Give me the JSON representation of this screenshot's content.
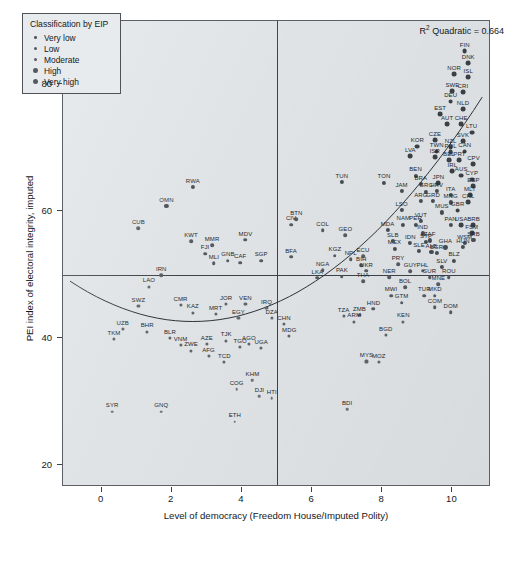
{
  "chart": {
    "type": "scatter",
    "title": "",
    "annotation": "R² Quadratic = 0.664",
    "annotation_prefix": "R",
    "annotation_sup": "2",
    "annotation_suffix": " Quadratic = 0.664",
    "xlabel": "Level of democracy (Freedom House/Imputed Polity)",
    "ylabel": "PEI index of electoral integrity, imputed",
    "xlim": [
      -1.1,
      11.1
    ],
    "ylim": [
      16.5,
      90.0
    ],
    "xticks": [
      0,
      2,
      4,
      6,
      8,
      10
    ],
    "yticks": [
      20,
      40,
      60,
      80
    ],
    "grid": false,
    "ref_line_h": 50,
    "ref_line_v": 5,
    "background_color": "#dfe3e6",
    "point_color": "#4a5056",
    "frame_color": "#5a6066"
  },
  "legend": {
    "title": "Classification by EIP",
    "position": "top-left",
    "items": [
      {
        "label": "Very low",
        "key": "vlow"
      },
      {
        "label": "Low",
        "key": "low"
      },
      {
        "label": "Moderate",
        "key": "mod"
      },
      {
        "label": "High",
        "key": "high"
      },
      {
        "label": "Very high",
        "key": "vhigh"
      }
    ]
  },
  "chart_data": {
    "type": "scatter",
    "title": "",
    "xlabel": "Level of democracy (Freedom House/Imputed Polity)",
    "ylabel": "PEI index of electoral integrity, imputed",
    "xlim": [
      -1.1,
      11.1
    ],
    "ylim": [
      16.5,
      90.0
    ],
    "xticks": [
      0,
      2,
      4,
      6,
      8,
      10
    ],
    "yticks": [
      20,
      40,
      60,
      80
    ],
    "grid": false,
    "annotation": "R² Quadratic = 0.664",
    "r2_quadratic": 0.664,
    "reference_lines": {
      "horizontal_y": 50,
      "vertical_x": 5
    },
    "legend_title": "Classification by EIP",
    "legend_entries": [
      "Very low",
      "Low",
      "Moderate",
      "High",
      "Very high"
    ],
    "fit": {
      "kind": "quadratic",
      "note": "U-shaped quadratic trend line fitted across the full x-range"
    },
    "points": [
      {
        "label": "FIN",
        "x": 10.35,
        "y": 85.2,
        "cls": "vhigh"
      },
      {
        "label": "DNK",
        "x": 10.45,
        "y": 83.3,
        "cls": "vhigh"
      },
      {
        "label": "NOR",
        "x": 10.05,
        "y": 81.6,
        "cls": "vhigh"
      },
      {
        "label": "ISL",
        "x": 10.45,
        "y": 81.2,
        "cls": "vhigh"
      },
      {
        "label": "SWE",
        "x": 10.0,
        "y": 78.9,
        "cls": "vhigh"
      },
      {
        "label": "CRI",
        "x": 10.3,
        "y": 78.8,
        "cls": "vhigh"
      },
      {
        "label": "DEU",
        "x": 9.95,
        "y": 77.3,
        "cls": "vhigh"
      },
      {
        "label": "NLD",
        "x": 10.3,
        "y": 76.1,
        "cls": "vhigh"
      },
      {
        "label": "EST",
        "x": 9.65,
        "y": 75.3,
        "cls": "vhigh"
      },
      {
        "label": "AUT",
        "x": 9.85,
        "y": 73.8,
        "cls": "vhigh"
      },
      {
        "label": "CHE",
        "x": 10.25,
        "y": 73.7,
        "cls": "vhigh"
      },
      {
        "label": "LTU",
        "x": 10.55,
        "y": 72.4,
        "cls": "vhigh"
      },
      {
        "label": "CZE",
        "x": 9.5,
        "y": 71.2,
        "cls": "vhigh"
      },
      {
        "label": "SVK",
        "x": 10.3,
        "y": 71.0,
        "cls": "vhigh"
      },
      {
        "label": "NZL",
        "x": 9.95,
        "y": 70.1,
        "cls": "vhigh"
      },
      {
        "label": "KOR",
        "x": 9.0,
        "y": 70.2,
        "cls": "vhigh"
      },
      {
        "label": "TWN",
        "x": 9.55,
        "y": 69.4,
        "cls": "vhigh"
      },
      {
        "label": "POL",
        "x": 9.95,
        "y": 69.3,
        "cls": "vhigh"
      },
      {
        "label": "CAN",
        "x": 10.35,
        "y": 69.4,
        "cls": "vhigh"
      },
      {
        "label": "LVA",
        "x": 8.8,
        "y": 68.7,
        "cls": "vhigh"
      },
      {
        "label": "ISR",
        "x": 9.5,
        "y": 68.5,
        "cls": "vhigh"
      },
      {
        "label": "BEL",
        "x": 9.9,
        "y": 68.0,
        "cls": "vhigh"
      },
      {
        "label": "PRT",
        "x": 10.2,
        "y": 68.0,
        "cls": "vhigh"
      },
      {
        "label": "CPV",
        "x": 10.6,
        "y": 67.4,
        "cls": "vhigh"
      },
      {
        "label": "IRL",
        "x": 10.0,
        "y": 66.3,
        "cls": "vhigh"
      },
      {
        "label": "AUS",
        "x": 10.25,
        "y": 65.6,
        "cls": "vhigh"
      },
      {
        "label": "BEN",
        "x": 8.95,
        "y": 65.6,
        "cls": "high"
      },
      {
        "label": "CYP",
        "x": 10.55,
        "y": 65.0,
        "cls": "vhigh"
      },
      {
        "label": "ESP",
        "x": 10.6,
        "y": 63.9,
        "cls": "vhigh"
      },
      {
        "label": "JPN",
        "x": 9.6,
        "y": 64.4,
        "cls": "vhigh"
      },
      {
        "label": "BRA",
        "x": 9.1,
        "y": 64.3,
        "cls": "high"
      },
      {
        "label": "TON",
        "x": 8.05,
        "y": 64.5,
        "cls": "high"
      },
      {
        "label": "TUN",
        "x": 6.85,
        "y": 64.6,
        "cls": "high"
      },
      {
        "label": "HRV",
        "x": 9.55,
        "y": 63.2,
        "cls": "high"
      },
      {
        "label": "GRC",
        "x": 9.25,
        "y": 63.1,
        "cls": "high"
      },
      {
        "label": "JAM",
        "x": 8.55,
        "y": 63.2,
        "cls": "high"
      },
      {
        "label": "ITA",
        "x": 9.95,
        "y": 62.6,
        "cls": "high"
      },
      {
        "label": "MLT",
        "x": 10.5,
        "y": 62.6,
        "cls": "vhigh"
      },
      {
        "label": "ARG",
        "x": 9.1,
        "y": 61.6,
        "cls": "high"
      },
      {
        "label": "GRD",
        "x": 9.45,
        "y": 61.6,
        "cls": "high"
      },
      {
        "label": "MNG",
        "x": 9.95,
        "y": 61.4,
        "cls": "high"
      },
      {
        "label": "CHL",
        "x": 10.45,
        "y": 61.4,
        "cls": "vhigh"
      },
      {
        "label": "LSO",
        "x": 8.55,
        "y": 60.2,
        "cls": "high"
      },
      {
        "label": "MUS",
        "x": 9.7,
        "y": 59.8,
        "cls": "high"
      },
      {
        "label": "GBR",
        "x": 10.15,
        "y": 60.1,
        "cls": "vhigh"
      },
      {
        "label": "VUT",
        "x": 9.1,
        "y": 58.5,
        "cls": "high"
      },
      {
        "label": "NAM",
        "x": 8.6,
        "y": 57.9,
        "cls": "high"
      },
      {
        "label": "PER",
        "x": 8.95,
        "y": 57.9,
        "cls": "high"
      },
      {
        "label": "PAN",
        "x": 9.95,
        "y": 57.8,
        "cls": "high"
      },
      {
        "label": "USA",
        "x": 10.25,
        "y": 57.8,
        "cls": "vhigh"
      },
      {
        "label": "BRB",
        "x": 10.6,
        "y": 57.8,
        "cls": "vhigh"
      },
      {
        "label": "FSM",
        "x": 10.55,
        "y": 56.5,
        "cls": "vhigh"
      },
      {
        "label": "IND",
        "x": 9.15,
        "y": 56.5,
        "cls": "high"
      },
      {
        "label": "MDA",
        "x": 8.15,
        "y": 57.0,
        "cls": "high"
      },
      {
        "label": "ZAF",
        "x": 9.35,
        "y": 55.4,
        "cls": "high"
      },
      {
        "label": "IDN",
        "x": 8.8,
        "y": 55.0,
        "cls": "high"
      },
      {
        "label": "STP",
        "x": 9.25,
        "y": 55.1,
        "cls": "high"
      },
      {
        "label": "WSM",
        "x": 10.35,
        "y": 55.0,
        "cls": "high"
      },
      {
        "label": "GHA",
        "x": 9.8,
        "y": 54.3,
        "cls": "high"
      },
      {
        "label": "HUN",
        "x": 10.3,
        "y": 54.4,
        "cls": "high"
      },
      {
        "label": "SLE",
        "x": 9.05,
        "y": 53.7,
        "cls": "high"
      },
      {
        "label": "ALB",
        "x": 9.4,
        "y": 53.6,
        "cls": "high"
      },
      {
        "label": "BGR",
        "x": 9.55,
        "y": 53.4,
        "cls": "high"
      },
      {
        "label": "BLZ",
        "x": 10.05,
        "y": 52.2,
        "cls": "high"
      },
      {
        "label": "SRB",
        "x": 10.6,
        "y": 55.5,
        "cls": "high"
      },
      {
        "label": "MEX",
        "x": 8.35,
        "y": 54.1,
        "cls": "high"
      },
      {
        "label": "SLB",
        "x": 8.3,
        "y": 55.3,
        "cls": "high"
      },
      {
        "label": "COL",
        "x": 6.3,
        "y": 57.0,
        "cls": "mod"
      },
      {
        "label": "GEO",
        "x": 6.95,
        "y": 56.2,
        "cls": "mod"
      },
      {
        "label": "BTN",
        "x": 5.55,
        "y": 58.7,
        "cls": "mod"
      },
      {
        "label": "CIV",
        "x": 5.4,
        "y": 57.9,
        "cls": "mod"
      },
      {
        "label": "MDV",
        "x": 4.1,
        "y": 55.5,
        "cls": "mod"
      },
      {
        "label": "ECU",
        "x": 7.45,
        "y": 52.9,
        "cls": "mod"
      },
      {
        "label": "SLV",
        "x": 9.7,
        "y": 51.2,
        "cls": "high"
      },
      {
        "label": "ROU",
        "x": 9.9,
        "y": 49.6,
        "cls": "mod"
      },
      {
        "label": "PHL",
        "x": 9.15,
        "y": 50.6,
        "cls": "mod"
      },
      {
        "label": "SUR",
        "x": 9.35,
        "y": 49.6,
        "cls": "mod"
      },
      {
        "label": "MNE",
        "x": 9.6,
        "y": 48.5,
        "cls": "mod"
      },
      {
        "label": "MKD",
        "x": 9.5,
        "y": 46.7,
        "cls": "mod"
      },
      {
        "label": "DOM",
        "x": 9.95,
        "y": 44.1,
        "cls": "mod"
      },
      {
        "label": "PRY",
        "x": 8.45,
        "y": 51.6,
        "cls": "mod"
      },
      {
        "label": "GUY",
        "x": 8.8,
        "y": 50.5,
        "cls": "mod"
      },
      {
        "label": "NPL",
        "x": 7.1,
        "y": 52.4,
        "cls": "mod"
      },
      {
        "label": "BIH",
        "x": 7.4,
        "y": 51.5,
        "cls": "mod"
      },
      {
        "label": "KGZ",
        "x": 6.65,
        "y": 53.0,
        "cls": "mod"
      },
      {
        "label": "UKR",
        "x": 7.55,
        "y": 50.6,
        "cls": "mod"
      },
      {
        "label": "NER",
        "x": 8.2,
        "y": 49.6,
        "cls": "mod"
      },
      {
        "label": "THA",
        "x": 7.45,
        "y": 49.0,
        "cls": "mod"
      },
      {
        "label": "PAK",
        "x": 6.85,
        "y": 49.7,
        "cls": "mod"
      },
      {
        "label": "LKA",
        "x": 6.15,
        "y": 49.5,
        "cls": "mod"
      },
      {
        "label": "NGA",
        "x": 6.3,
        "y": 50.7,
        "cls": "mod"
      },
      {
        "label": "BFA",
        "x": 5.4,
        "y": 52.8,
        "cls": "mod"
      },
      {
        "label": "BOL",
        "x": 8.65,
        "y": 48.0,
        "cls": "mod"
      },
      {
        "label": "MWI",
        "x": 8.25,
        "y": 46.7,
        "cls": "mod"
      },
      {
        "label": "TUR",
        "x": 9.2,
        "y": 46.7,
        "cls": "mod"
      },
      {
        "label": "GTM",
        "x": 8.55,
        "y": 45.6,
        "cls": "mod"
      },
      {
        "label": "COM",
        "x": 9.5,
        "y": 44.9,
        "cls": "mod"
      },
      {
        "label": "HND",
        "x": 7.75,
        "y": 44.6,
        "cls": "mod"
      },
      {
        "label": "KEN",
        "x": 8.6,
        "y": 42.6,
        "cls": "low"
      },
      {
        "label": "TZA",
        "x": 6.9,
        "y": 43.5,
        "cls": "low"
      },
      {
        "label": "ZMB",
        "x": 7.35,
        "y": 43.6,
        "cls": "low"
      },
      {
        "label": "ARM",
        "x": 7.2,
        "y": 42.6,
        "cls": "low"
      },
      {
        "label": "BGD",
        "x": 8.1,
        "y": 40.5,
        "cls": "low"
      },
      {
        "label": "MYS",
        "x": 7.55,
        "y": 36.3,
        "cls": "low"
      },
      {
        "label": "MOZ",
        "x": 7.9,
        "y": 36.2,
        "cls": "low"
      },
      {
        "label": "BDI",
        "x": 7.0,
        "y": 28.8,
        "cls": "vlow"
      },
      {
        "label": "SGP",
        "x": 4.55,
        "y": 52.2,
        "cls": "mod"
      },
      {
        "label": "CAF",
        "x": 3.95,
        "y": 51.9,
        "cls": "mod"
      },
      {
        "label": "GNB",
        "x": 3.6,
        "y": 52.2,
        "cls": "mod"
      },
      {
        "label": "MLI",
        "x": 3.2,
        "y": 51.8,
        "cls": "mod"
      },
      {
        "label": "FJI",
        "x": 2.95,
        "y": 53.3,
        "cls": "mod"
      },
      {
        "label": "MMR",
        "x": 3.15,
        "y": 54.6,
        "cls": "mod"
      },
      {
        "label": "KWT",
        "x": 2.55,
        "y": 55.3,
        "cls": "mod"
      },
      {
        "label": "CUB",
        "x": 1.05,
        "y": 57.3,
        "cls": "mod"
      },
      {
        "label": "OMN",
        "x": 1.85,
        "y": 60.8,
        "cls": "high"
      },
      {
        "label": "RWA",
        "x": 2.6,
        "y": 63.8,
        "cls": "high"
      },
      {
        "label": "IRN",
        "x": 1.7,
        "y": 49.9,
        "cls": "mod"
      },
      {
        "label": "LAO",
        "x": 1.35,
        "y": 48.1,
        "cls": "low"
      },
      {
        "label": "SWZ",
        "x": 1.05,
        "y": 45.0,
        "cls": "low"
      },
      {
        "label": "CMR",
        "x": 2.25,
        "y": 45.2,
        "cls": "low"
      },
      {
        "label": "KAZ",
        "x": 2.6,
        "y": 44.0,
        "cls": "low"
      },
      {
        "label": "MRT",
        "x": 3.25,
        "y": 43.8,
        "cls": "low"
      },
      {
        "label": "JOR",
        "x": 3.55,
        "y": 45.4,
        "cls": "low"
      },
      {
        "label": "VEN",
        "x": 4.1,
        "y": 45.3,
        "cls": "low"
      },
      {
        "label": "IRQ",
        "x": 4.7,
        "y": 44.7,
        "cls": "low"
      },
      {
        "label": "EGY",
        "x": 3.9,
        "y": 43.2,
        "cls": "low"
      },
      {
        "label": "DZA",
        "x": 4.85,
        "y": 43.2,
        "cls": "low"
      },
      {
        "label": "CHN",
        "x": 5.2,
        "y": 42.2,
        "cls": "low"
      },
      {
        "label": "UZB",
        "x": 0.6,
        "y": 41.4,
        "cls": "low"
      },
      {
        "label": "BHR",
        "x": 1.3,
        "y": 41.0,
        "cls": "low"
      },
      {
        "label": "TKM",
        "x": 0.35,
        "y": 39.8,
        "cls": "low"
      },
      {
        "label": "BLR",
        "x": 1.95,
        "y": 40.0,
        "cls": "low"
      },
      {
        "label": "VNM",
        "x": 2.25,
        "y": 38.9,
        "cls": "low"
      },
      {
        "label": "AZE",
        "x": 3.0,
        "y": 39.0,
        "cls": "low"
      },
      {
        "label": "TJK",
        "x": 3.55,
        "y": 39.6,
        "cls": "low"
      },
      {
        "label": "AGO",
        "x": 4.2,
        "y": 39.0,
        "cls": "low"
      },
      {
        "label": "ZWE",
        "x": 2.55,
        "y": 38.0,
        "cls": "low"
      },
      {
        "label": "AFG",
        "x": 3.05,
        "y": 37.1,
        "cls": "low"
      },
      {
        "label": "TCD",
        "x": 3.5,
        "y": 36.2,
        "cls": "low"
      },
      {
        "label": "MDG",
        "x": 5.35,
        "y": 40.3,
        "cls": "low"
      },
      {
        "label": "TGO",
        "x": 3.95,
        "y": 38.6,
        "cls": "low"
      },
      {
        "label": "UGA",
        "x": 4.55,
        "y": 38.4,
        "cls": "low"
      },
      {
        "label": "KHM",
        "x": 4.3,
        "y": 33.3,
        "cls": "vlow"
      },
      {
        "label": "DJI",
        "x": 4.5,
        "y": 30.8,
        "cls": "vlow"
      },
      {
        "label": "HTI",
        "x": 4.85,
        "y": 30.5,
        "cls": "vlow"
      },
      {
        "label": "COG",
        "x": 3.85,
        "y": 31.9,
        "cls": "vlow"
      },
      {
        "label": "SYR",
        "x": 0.3,
        "y": 28.4,
        "cls": "vlow"
      },
      {
        "label": "GNQ",
        "x": 1.7,
        "y": 28.4,
        "cls": "vlow"
      },
      {
        "label": "ETH",
        "x": 3.8,
        "y": 26.8,
        "cls": "vlow"
      }
    ]
  }
}
